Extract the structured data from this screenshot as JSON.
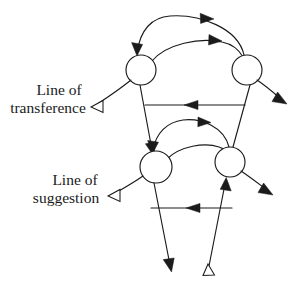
{
  "figure": {
    "background_color": "#ffffff",
    "stroke_color": "#1b1b1b",
    "text_color": "#1a1a1a",
    "width": 298,
    "height": 285
  },
  "labels": {
    "transference": {
      "line1": "Line of",
      "line2": "transference",
      "pointer": "hollow-triangle-left"
    },
    "suggestion": {
      "line1": "Line of",
      "line2": "suggestion",
      "pointer": "hollow-triangle-left"
    }
  },
  "nodes": [
    {
      "id": "top-left",
      "cx": 141,
      "cy": 70,
      "r": 15
    },
    {
      "id": "top-right",
      "cx": 247,
      "cy": 70,
      "r": 15
    },
    {
      "id": "bottom-left",
      "cx": 156,
      "cy": 167,
      "r": 16
    },
    {
      "id": "bottom-right",
      "cx": 230,
      "cy": 162,
      "r": 15
    }
  ],
  "edges": [
    {
      "id": "top-outer-arc",
      "from": "top-right",
      "to": "top-left",
      "style": "arc",
      "head": "solid"
    },
    {
      "id": "top-inner-arc",
      "from": "top-left",
      "to": "top-right",
      "style": "arc",
      "head": "solid"
    },
    {
      "id": "top-horizontal",
      "from": "top-right",
      "to": "top-left",
      "style": "straight",
      "head": "solid"
    },
    {
      "id": "left-diagonal-down",
      "from": "top-left",
      "to": "bottom-left",
      "style": "straight",
      "head": "solid"
    },
    {
      "id": "right-diagonal-down",
      "from": "top-right",
      "to": "bottom-right",
      "style": "straight",
      "head": "none"
    },
    {
      "id": "bottom-outer-arc",
      "from": "bottom-right",
      "to": "bottom-left",
      "style": "arc",
      "head": "solid"
    },
    {
      "id": "bottom-inner-arc",
      "from": "bottom-left",
      "to": "bottom-right",
      "style": "arc",
      "head": "solid"
    },
    {
      "id": "bottom-horizontal",
      "from": "bottom-right",
      "to": "bottom-left",
      "style": "straight",
      "head": "solid"
    },
    {
      "id": "bottom-left-exit",
      "from": "bottom-left",
      "to": "below",
      "style": "straight",
      "head": "solid"
    },
    {
      "id": "bottom-right-entry",
      "from": "below",
      "to": "bottom-right",
      "style": "straight",
      "head": "solid"
    },
    {
      "id": "top-right-exit",
      "from": "top-right",
      "to": "outward",
      "style": "curve",
      "head": "solid"
    },
    {
      "id": "bottom-right-exit",
      "from": "bottom-right",
      "to": "outward",
      "style": "curve",
      "head": "solid"
    },
    {
      "id": "transference-pointer",
      "from": "top-left",
      "to": "transference-label",
      "style": "curve",
      "head": "hollow"
    },
    {
      "id": "suggestion-pointer",
      "from": "bottom-left",
      "to": "suggestion-label",
      "style": "curve",
      "head": "hollow"
    },
    {
      "id": "bottom-terminal",
      "from": "bottom-right-entry",
      "to": "terminal",
      "style": "straight",
      "head": "hollow"
    }
  ]
}
